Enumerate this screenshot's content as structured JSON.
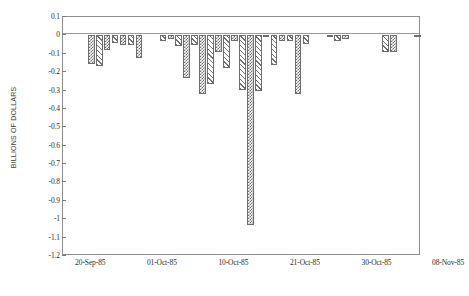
{
  "chart_data": {
    "type": "bar",
    "title": "",
    "subtitle": "",
    "xlabel": "",
    "ylabel": "BILLIONS OF DOLLARS",
    "ylim": [
      -1.2,
      0.1
    ],
    "grid": false,
    "legend": null,
    "ytick_labels": [
      "0.1",
      "0",
      "-0.1",
      "-0.2",
      "-0.3",
      "-0.4",
      "-0.5",
      "-0.6",
      "-0.7",
      "-0.8",
      "-0.9",
      "-1",
      "-1.1",
      "-1.2"
    ],
    "ytick_values": [
      0.1,
      0,
      -0.1,
      -0.2,
      -0.3,
      -0.4,
      -0.5,
      -0.6,
      -0.7,
      -0.8,
      -0.9,
      -1.0,
      -1.1,
      -1.2
    ],
    "xtick_labels": [
      "20-Sep-85",
      "01-Oct-85",
      "10-Oct-85",
      "21-Oct-85",
      "30-Oct-85",
      "08-Nov-85"
    ],
    "xtick_positions": [
      0,
      9,
      18,
      27,
      36,
      45
    ],
    "bar_fill_patterns": [
      "checker",
      "hatch"
    ],
    "bar_edge_color": "#6d6d6d",
    "axis_color": "#8e8e8e",
    "values": [
      -0.155,
      -0.168,
      -0.082,
      -0.04,
      -0.055,
      -0.052,
      -0.122,
      0.0,
      0.0,
      -0.03,
      -0.022,
      -0.06,
      -0.23,
      -0.052,
      -0.318,
      -0.265,
      -0.09,
      -0.175,
      -0.032,
      -0.295,
      -1.03,
      -0.3,
      -0.01,
      -0.16,
      -0.032,
      -0.03,
      -0.318,
      -0.045,
      0.0,
      0.0,
      -0.005,
      -0.03,
      -0.02,
      0.0,
      0.0,
      0.0,
      0.0,
      -0.09,
      -0.088,
      0.0,
      0.0,
      -0.006
    ],
    "categories": [
      "20-Sep-85",
      "",
      "",
      "",
      "",
      "",
      "01-Oct-85",
      "",
      "",
      "",
      "",
      "",
      "10-Oct-85",
      "",
      "",
      "",
      "",
      "",
      "21-Oct-85",
      "",
      "",
      "",
      "",
      "",
      "30-Oct-85",
      "",
      "",
      "",
      "",
      "",
      "08-Nov-85",
      "",
      "",
      "",
      "",
      "",
      "",
      "",
      "",
      "",
      "",
      ""
    ]
  }
}
